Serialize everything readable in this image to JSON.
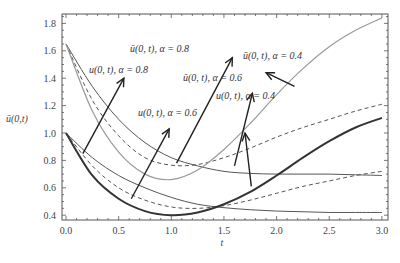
{
  "chart_data": {
    "type": "line",
    "title": "",
    "xlabel": "t",
    "ylabel": "ū(0,t)",
    "xlim": [
      0,
      3.0
    ],
    "ylim": [
      0.38,
      1.86
    ],
    "xticks": [
      0.0,
      0.5,
      1.0,
      1.5,
      2.0,
      2.5,
      3.0
    ],
    "xtick_labels": [
      "0.0",
      "0.5",
      "1.0",
      "1.5",
      "2.0",
      "2.5",
      "3.0"
    ],
    "yticks": [
      0.4,
      0.6,
      0.8,
      1.0,
      1.2,
      1.4,
      1.6,
      1.8
    ],
    "ytick_labels": [
      "0.4",
      "0.6",
      "0.8",
      "1.0",
      "1.2",
      "1.4",
      "1.6",
      "1.8"
    ],
    "grid": false,
    "legend": "none (arrow annotations)",
    "x": [
      0.0,
      0.25,
      0.5,
      0.75,
      1.0,
      1.25,
      1.5,
      1.75,
      2.0,
      2.25,
      2.5,
      2.75,
      3.0
    ],
    "series": [
      {
        "name": "ū(0,t), α=0.8",
        "style": "solid-thin-dark",
        "color": "#555555",
        "values": [
          1.65,
          1.34,
          1.1,
          0.93,
          0.82,
          0.76,
          0.72,
          0.705,
          0.7,
          0.7,
          0.7,
          0.695,
          0.69
        ]
      },
      {
        "name": "ū(0,t), α=0.6",
        "style": "dashed",
        "color": "#555555",
        "values": [
          1.65,
          1.24,
          0.98,
          0.82,
          0.765,
          0.77,
          0.82,
          0.89,
          0.97,
          1.04,
          1.1,
          1.16,
          1.21
        ]
      },
      {
        "name": "ū(0,t), α=0.4",
        "style": "solid-light-gray",
        "color": "#999999",
        "values": [
          1.65,
          1.16,
          0.86,
          0.7,
          0.66,
          0.73,
          0.88,
          1.07,
          1.28,
          1.47,
          1.63,
          1.75,
          1.84
        ]
      },
      {
        "name": "u(0,t), α=0.8",
        "style": "solid-thin-dark",
        "color": "#555555",
        "values": [
          1.0,
          0.82,
          0.69,
          0.6,
          0.53,
          0.48,
          0.455,
          0.44,
          0.43,
          0.425,
          0.42,
          0.42,
          0.42
        ]
      },
      {
        "name": "u(0,t), α=0.6",
        "style": "dashed",
        "color": "#555555",
        "values": [
          1.0,
          0.76,
          0.6,
          0.51,
          0.46,
          0.45,
          0.47,
          0.51,
          0.56,
          0.61,
          0.65,
          0.69,
          0.72
        ]
      },
      {
        "name": "u(0,t), α=0.4",
        "style": "solid-thick-dark",
        "color": "#333333",
        "values": [
          1.0,
          0.69,
          0.52,
          0.43,
          0.4,
          0.42,
          0.48,
          0.57,
          0.69,
          0.82,
          0.94,
          1.04,
          1.11
        ]
      }
    ],
    "annotations": [
      {
        "text": "ū(0,t), α = 0.8",
        "arrow_from": [
          1.05,
          0.78
        ],
        "arrow_to": [
          1.58,
          1.55
        ]
      },
      {
        "text": "u(0,t), α = 0.8",
        "arrow_from": [
          0.16,
          0.85
        ],
        "arrow_to": [
          0.55,
          1.4
        ]
      },
      {
        "text": "ū(0,t), α = 0.6",
        "arrow_from": [
          1.6,
          0.76
        ],
        "arrow_to": [
          1.77,
          1.29
        ]
      },
      {
        "text": "u(0,t), α = 0.6",
        "arrow_from": [
          0.62,
          0.52
        ],
        "arrow_to": [
          0.98,
          1.03
        ]
      },
      {
        "text": "u(0,t), α = 0.4",
        "arrow_from": [
          1.76,
          0.61
        ],
        "arrow_to": [
          1.7,
          1.0
        ]
      },
      {
        "text": "ū(0,t), α = 0.4",
        "arrow_from": [
          2.17,
          1.34
        ],
        "arrow_to": [
          1.9,
          1.44
        ]
      }
    ]
  },
  "labels": {
    "xlabel": "t",
    "ylabel": "ū(0,t)",
    "ann_ubar_08": "ū(0, t), α = 0.8",
    "ann_u_08": "u(0, t), α = 0.8",
    "ann_ubar_06": "ū(0, t), α = 0.6",
    "ann_u_06": "u(0, t), α = 0.6",
    "ann_u_04": "u(0, t), α = 0.4",
    "ann_ubar_04": "ū(0, t), α = 0.4"
  }
}
